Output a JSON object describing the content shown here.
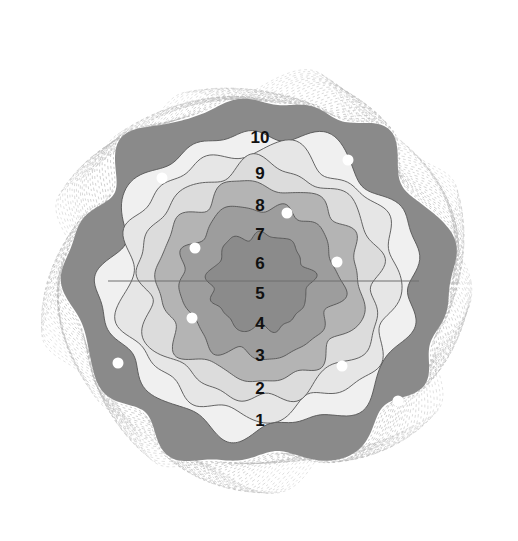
{
  "figure": {
    "background_color": "#ffffff",
    "canvas": {
      "width": 518,
      "height": 541
    },
    "center": {
      "x": 260,
      "y": 282
    },
    "axis_line": {
      "name": "horizontal-axis-line",
      "color": "#6f6f6f",
      "y": 281,
      "x_start": 108,
      "x_end": 419,
      "width": 1
    },
    "ring_labels": [
      {
        "label": "10",
        "x": 260,
        "y": 139
      },
      {
        "label": "9",
        "x": 260,
        "y": 175
      },
      {
        "label": "8",
        "x": 260,
        "y": 207
      },
      {
        "label": "7",
        "x": 260,
        "y": 236
      },
      {
        "label": "6",
        "x": 260,
        "y": 265
      },
      {
        "label": "5",
        "x": 260,
        "y": 295
      },
      {
        "label": "4",
        "x": 260,
        "y": 325
      },
      {
        "label": "3",
        "x": 260,
        "y": 357
      },
      {
        "label": "2",
        "x": 260,
        "y": 390
      },
      {
        "label": "1",
        "x": 260,
        "y": 422
      }
    ],
    "bands": [
      {
        "name": "band-outer-fringe",
        "level": 0,
        "radius": 196,
        "fill": "none",
        "hatched": true
      },
      {
        "name": "band-10-outer",
        "level": 11,
        "radius": 182,
        "fill": "#8a8a8a",
        "hatched": false
      },
      {
        "name": "band-10",
        "level": 10,
        "radius": 133,
        "fill": "#e6e6e6",
        "hatched": false
      },
      {
        "name": "band-9",
        "level": 9,
        "radius": 116,
        "fill": "#dcdcdc",
        "hatched": false
      },
      {
        "name": "band-8",
        "level": 8,
        "radius": 98,
        "fill": "#b4b4b4",
        "hatched": false
      },
      {
        "name": "band-7",
        "level": 7,
        "radius": 76,
        "fill": "#9d9d9d",
        "hatched": false
      },
      {
        "name": "band-6",
        "level": 6,
        "radius": 48,
        "fill": "#8b8b8b",
        "hatched": false
      },
      {
        "name": "band-5",
        "level": 5,
        "radius": 76,
        "fill": "#9d9d9d",
        "hatched": false
      },
      {
        "name": "band-4",
        "level": 4,
        "radius": 98,
        "fill": "#b4b4b4",
        "hatched": false
      },
      {
        "name": "band-3",
        "level": 3,
        "radius": 116,
        "fill": "#dcdcdc",
        "hatched": false
      },
      {
        "name": "band-2",
        "level": 2,
        "radius": 133,
        "fill": "#e6e6e6",
        "hatched": false
      },
      {
        "name": "band-1",
        "level": 1,
        "radius": 150,
        "fill": "#f0f0f0",
        "hatched": false
      }
    ],
    "contour_line_color": "#555555",
    "fringe_line_color": "#b8b8b8",
    "markers": {
      "name": "impact-markers",
      "color": "#ffffff",
      "radius": 5.5,
      "points": [
        {
          "x": 162,
          "y": 178
        },
        {
          "x": 348,
          "y": 160
        },
        {
          "x": 287,
          "y": 213
        },
        {
          "x": 195,
          "y": 248
        },
        {
          "x": 337,
          "y": 262
        },
        {
          "x": 192,
          "y": 318
        },
        {
          "x": 118,
          "y": 363
        },
        {
          "x": 342,
          "y": 366
        },
        {
          "x": 398,
          "y": 401
        }
      ]
    }
  },
  "chart_data": {
    "type": "contour",
    "rings": [
      10,
      9,
      8,
      7,
      6,
      5,
      4,
      3,
      2,
      1
    ],
    "ring_fill_colors": [
      "#e6e6e6",
      "#dcdcdc",
      "#b4b4b4",
      "#9d9d9d",
      "#8b8b8b",
      "#9d9d9d",
      "#b4b4b4",
      "#dcdcdc",
      "#e6e6e6",
      "#f0f0f0"
    ],
    "marker_count": 9,
    "legend": "none",
    "grid": false
  }
}
